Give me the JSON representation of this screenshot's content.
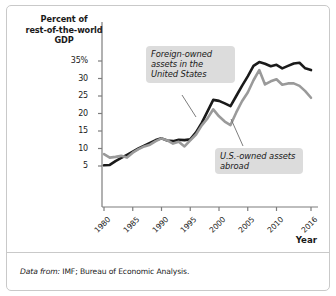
{
  "figure": {
    "border_color": "#c9c9c9",
    "background": "#ffffff"
  },
  "axis": {
    "y_title_line1": "Percent of",
    "y_title_line2": "rest-of-the-world",
    "y_title_line3": "GDP",
    "x_title": "Year",
    "y_ticks": [
      "35%",
      "30",
      "25",
      "20",
      "15",
      "10",
      "5"
    ],
    "x_ticks": [
      "1980",
      "1985",
      "1990",
      "1995",
      "2000",
      "2005",
      "2010",
      "2016"
    ]
  },
  "annotations": {
    "foreign_owned": "Foreign-owned assets in the United States",
    "us_owned": "U.S.-owned assets abroad"
  },
  "footnote": {
    "lead": "Data from:",
    "text": " IMF; Bureau of Economic Analysis."
  },
  "chart_data": {
    "type": "line",
    "title": "",
    "xlabel": "Year",
    "ylabel": "Percent of rest-of-the-world GDP",
    "xlim": [
      1980,
      2016
    ],
    "ylim": [
      3,
      36
    ],
    "grid": false,
    "legend_position": "annotations-inline",
    "x": [
      1980,
      1981,
      1982,
      1983,
      1984,
      1985,
      1986,
      1987,
      1988,
      1989,
      1990,
      1991,
      1992,
      1993,
      1994,
      1995,
      1996,
      1997,
      1998,
      1999,
      2000,
      2001,
      2002,
      2003,
      2004,
      2005,
      2006,
      2007,
      2008,
      2009,
      2010,
      2011,
      2012,
      2013,
      2014,
      2015,
      2016
    ],
    "series": [
      {
        "name": "Foreign-owned assets in the United States",
        "color": "#1a1a1a",
        "values": [
          5.2,
          5.3,
          6.4,
          7.3,
          8.2,
          9.1,
          10.0,
          10.8,
          11.6,
          12.4,
          12.9,
          12.3,
          12.1,
          12.5,
          12.4,
          12.6,
          14.6,
          17.3,
          20.6,
          23.9,
          23.6,
          22.9,
          22.1,
          25.0,
          27.9,
          30.6,
          33.6,
          34.7,
          34.2,
          33.5,
          33.9,
          32.9,
          33.6,
          34.3,
          34.5,
          32.9,
          32.4
        ],
        "style": "solid",
        "width": 2.6
      },
      {
        "name": "U.S.-owned assets abroad",
        "color": "#9a9a9a",
        "values": [
          8.4,
          7.4,
          7.6,
          7.9,
          7.4,
          8.8,
          9.8,
          10.6,
          11.1,
          12.1,
          12.9,
          12.3,
          11.4,
          11.9,
          10.6,
          12.3,
          14.0,
          16.6,
          18.6,
          21.2,
          19.2,
          17.7,
          16.7,
          20.3,
          23.5,
          26.0,
          29.5,
          32.4,
          28.3,
          29.2,
          29.8,
          28.2,
          28.6,
          28.6,
          27.9,
          26.4,
          24.5
        ],
        "style": "solid",
        "width": 2.6
      }
    ]
  }
}
